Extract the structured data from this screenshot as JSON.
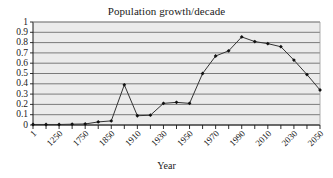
{
  "chart_data": {
    "type": "line",
    "title": "Population growth/decade",
    "xlabel": "Year",
    "ylabel": "",
    "ylim": [
      0,
      1
    ],
    "yticks": [
      "0",
      "0.1",
      "0.2",
      "0.3",
      "0.4",
      "0.5",
      "0.6",
      "0.7",
      "0.8",
      "0.9",
      "1"
    ],
    "grid": true,
    "legend": "none",
    "marker": "diamond",
    "line_color": "#333333",
    "grid_color": "#6e6e6e",
    "plot_bg": "#ebebeb",
    "x": [
      1,
      1000,
      1250,
      1500,
      1750,
      1800,
      1850,
      1880,
      1910,
      1920,
      1930,
      1940,
      1950,
      1960,
      1970,
      1980,
      1990,
      2000,
      2010,
      2020,
      2030,
      2040,
      2050
    ],
    "xtick_labels": [
      "1",
      "",
      "1250",
      "",
      "1750",
      "",
      "1850",
      "",
      "1910",
      "",
      "1930",
      "",
      "1950",
      "",
      "1970",
      "",
      "1990",
      "",
      "2010",
      "",
      "2030",
      "",
      "2050"
    ],
    "values": [
      0.005,
      0.005,
      0.005,
      0.008,
      0.01,
      0.03,
      0.04,
      0.39,
      0.09,
      0.095,
      0.21,
      0.22,
      0.21,
      0.5,
      0.67,
      0.72,
      0.855,
      0.81,
      0.79,
      0.76,
      0.63,
      0.49,
      0.34
    ]
  }
}
